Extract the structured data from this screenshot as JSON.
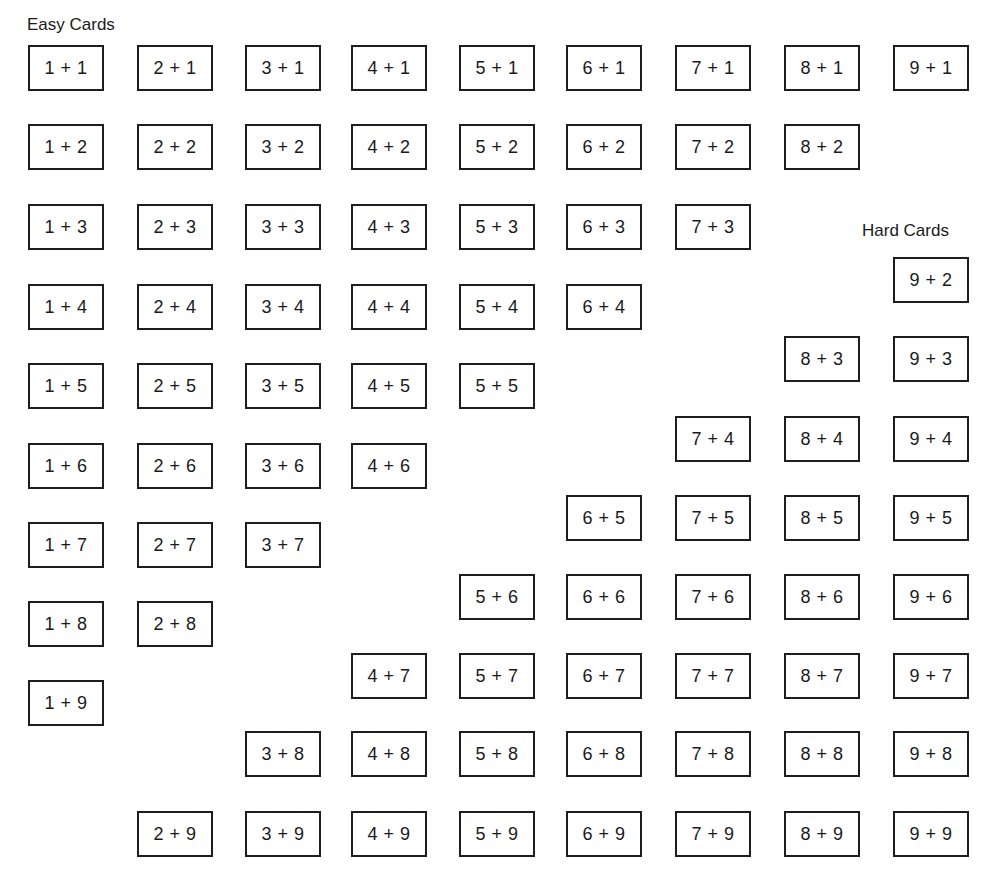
{
  "labels": {
    "easy": "Easy Cards",
    "hard": "Hard Cards"
  },
  "layout": {
    "col_x": [
      28,
      137,
      245,
      351,
      459,
      566,
      675,
      784,
      893
    ],
    "easy_row_y": [
      45,
      124,
      204,
      284,
      363,
      443,
      522,
      601,
      680
    ],
    "hard_row_y": [
      257,
      336,
      416,
      495,
      574,
      653,
      731,
      811
    ],
    "card_width": 76,
    "card_height": 46
  },
  "cards": [
    {
      "a": 1,
      "b": 1,
      "text": "1 + 1",
      "group": "easy",
      "col": 0,
      "y": 45
    },
    {
      "a": 2,
      "b": 1,
      "text": "2 + 1",
      "group": "easy",
      "col": 1,
      "y": 45
    },
    {
      "a": 3,
      "b": 1,
      "text": "3 + 1",
      "group": "easy",
      "col": 2,
      "y": 45
    },
    {
      "a": 4,
      "b": 1,
      "text": "4 + 1",
      "group": "easy",
      "col": 3,
      "y": 45
    },
    {
      "a": 5,
      "b": 1,
      "text": "5 + 1",
      "group": "easy",
      "col": 4,
      "y": 45
    },
    {
      "a": 6,
      "b": 1,
      "text": "6 + 1",
      "group": "easy",
      "col": 5,
      "y": 45
    },
    {
      "a": 7,
      "b": 1,
      "text": "7 + 1",
      "group": "easy",
      "col": 6,
      "y": 45
    },
    {
      "a": 8,
      "b": 1,
      "text": "8 + 1",
      "group": "easy",
      "col": 7,
      "y": 45
    },
    {
      "a": 9,
      "b": 1,
      "text": "9 + 1",
      "group": "easy",
      "col": 8,
      "y": 45
    },
    {
      "a": 1,
      "b": 2,
      "text": "1 + 2",
      "group": "easy",
      "col": 0,
      "y": 124
    },
    {
      "a": 2,
      "b": 2,
      "text": "2 + 2",
      "group": "easy",
      "col": 1,
      "y": 124
    },
    {
      "a": 3,
      "b": 2,
      "text": "3 + 2",
      "group": "easy",
      "col": 2,
      "y": 124
    },
    {
      "a": 4,
      "b": 2,
      "text": "4 + 2",
      "group": "easy",
      "col": 3,
      "y": 124
    },
    {
      "a": 5,
      "b": 2,
      "text": "5 + 2",
      "group": "easy",
      "col": 4,
      "y": 124
    },
    {
      "a": 6,
      "b": 2,
      "text": "6 + 2",
      "group": "easy",
      "col": 5,
      "y": 124
    },
    {
      "a": 7,
      "b": 2,
      "text": "7 + 2",
      "group": "easy",
      "col": 6,
      "y": 124
    },
    {
      "a": 8,
      "b": 2,
      "text": "8 + 2",
      "group": "easy",
      "col": 7,
      "y": 124
    },
    {
      "a": 1,
      "b": 3,
      "text": "1 + 3",
      "group": "easy",
      "col": 0,
      "y": 204
    },
    {
      "a": 2,
      "b": 3,
      "text": "2 + 3",
      "group": "easy",
      "col": 1,
      "y": 204
    },
    {
      "a": 3,
      "b": 3,
      "text": "3 + 3",
      "group": "easy",
      "col": 2,
      "y": 204
    },
    {
      "a": 4,
      "b": 3,
      "text": "4 + 3",
      "group": "easy",
      "col": 3,
      "y": 204
    },
    {
      "a": 5,
      "b": 3,
      "text": "5 + 3",
      "group": "easy",
      "col": 4,
      "y": 204
    },
    {
      "a": 6,
      "b": 3,
      "text": "6 + 3",
      "group": "easy",
      "col": 5,
      "y": 204
    },
    {
      "a": 7,
      "b": 3,
      "text": "7 + 3",
      "group": "easy",
      "col": 6,
      "y": 204
    },
    {
      "a": 1,
      "b": 4,
      "text": "1 + 4",
      "group": "easy",
      "col": 0,
      "y": 284
    },
    {
      "a": 2,
      "b": 4,
      "text": "2 + 4",
      "group": "easy",
      "col": 1,
      "y": 284
    },
    {
      "a": 3,
      "b": 4,
      "text": "3 + 4",
      "group": "easy",
      "col": 2,
      "y": 284
    },
    {
      "a": 4,
      "b": 4,
      "text": "4 + 4",
      "group": "easy",
      "col": 3,
      "y": 284
    },
    {
      "a": 5,
      "b": 4,
      "text": "5 + 4",
      "group": "easy",
      "col": 4,
      "y": 284
    },
    {
      "a": 6,
      "b": 4,
      "text": "6 + 4",
      "group": "easy",
      "col": 5,
      "y": 284
    },
    {
      "a": 1,
      "b": 5,
      "text": "1 + 5",
      "group": "easy",
      "col": 0,
      "y": 363
    },
    {
      "a": 2,
      "b": 5,
      "text": "2 + 5",
      "group": "easy",
      "col": 1,
      "y": 363
    },
    {
      "a": 3,
      "b": 5,
      "text": "3 + 5",
      "group": "easy",
      "col": 2,
      "y": 363
    },
    {
      "a": 4,
      "b": 5,
      "text": "4 + 5",
      "group": "easy",
      "col": 3,
      "y": 363
    },
    {
      "a": 5,
      "b": 5,
      "text": "5 + 5",
      "group": "easy",
      "col": 4,
      "y": 363
    },
    {
      "a": 1,
      "b": 6,
      "text": "1 + 6",
      "group": "easy",
      "col": 0,
      "y": 443
    },
    {
      "a": 2,
      "b": 6,
      "text": "2 + 6",
      "group": "easy",
      "col": 1,
      "y": 443
    },
    {
      "a": 3,
      "b": 6,
      "text": "3 + 6",
      "group": "easy",
      "col": 2,
      "y": 443
    },
    {
      "a": 4,
      "b": 6,
      "text": "4 + 6",
      "group": "easy",
      "col": 3,
      "y": 443
    },
    {
      "a": 1,
      "b": 7,
      "text": "1 + 7",
      "group": "easy",
      "col": 0,
      "y": 522
    },
    {
      "a": 2,
      "b": 7,
      "text": "2 + 7",
      "group": "easy",
      "col": 1,
      "y": 522
    },
    {
      "a": 3,
      "b": 7,
      "text": "3 + 7",
      "group": "easy",
      "col": 2,
      "y": 522
    },
    {
      "a": 1,
      "b": 8,
      "text": "1 + 8",
      "group": "easy",
      "col": 0,
      "y": 601
    },
    {
      "a": 2,
      "b": 8,
      "text": "2 + 8",
      "group": "easy",
      "col": 1,
      "y": 601
    },
    {
      "a": 1,
      "b": 9,
      "text": "1 + 9",
      "group": "easy",
      "col": 0,
      "y": 680
    },
    {
      "a": 9,
      "b": 2,
      "text": "9 + 2",
      "group": "hard",
      "col": 8,
      "y": 257
    },
    {
      "a": 8,
      "b": 3,
      "text": "8 + 3",
      "group": "hard",
      "col": 7,
      "y": 336
    },
    {
      "a": 9,
      "b": 3,
      "text": "9 + 3",
      "group": "hard",
      "col": 8,
      "y": 336
    },
    {
      "a": 7,
      "b": 4,
      "text": "7 + 4",
      "group": "hard",
      "col": 6,
      "y": 416
    },
    {
      "a": 8,
      "b": 4,
      "text": "8 + 4",
      "group": "hard",
      "col": 7,
      "y": 416
    },
    {
      "a": 9,
      "b": 4,
      "text": "9 + 4",
      "group": "hard",
      "col": 8,
      "y": 416
    },
    {
      "a": 6,
      "b": 5,
      "text": "6 + 5",
      "group": "hard",
      "col": 5,
      "y": 495
    },
    {
      "a": 7,
      "b": 5,
      "text": "7 + 5",
      "group": "hard",
      "col": 6,
      "y": 495
    },
    {
      "a": 8,
      "b": 5,
      "text": "8 + 5",
      "group": "hard",
      "col": 7,
      "y": 495
    },
    {
      "a": 9,
      "b": 5,
      "text": "9 + 5",
      "group": "hard",
      "col": 8,
      "y": 495
    },
    {
      "a": 5,
      "b": 6,
      "text": "5 + 6",
      "group": "hard",
      "col": 4,
      "y": 574
    },
    {
      "a": 6,
      "b": 6,
      "text": "6 + 6",
      "group": "hard",
      "col": 5,
      "y": 574
    },
    {
      "a": 7,
      "b": 6,
      "text": "7 + 6",
      "group": "hard",
      "col": 6,
      "y": 574
    },
    {
      "a": 8,
      "b": 6,
      "text": "8 + 6",
      "group": "hard",
      "col": 7,
      "y": 574
    },
    {
      "a": 9,
      "b": 6,
      "text": "9 + 6",
      "group": "hard",
      "col": 8,
      "y": 574
    },
    {
      "a": 4,
      "b": 7,
      "text": "4 + 7",
      "group": "hard",
      "col": 3,
      "y": 653
    },
    {
      "a": 5,
      "b": 7,
      "text": "5 + 7",
      "group": "hard",
      "col": 4,
      "y": 653
    },
    {
      "a": 6,
      "b": 7,
      "text": "6 + 7",
      "group": "hard",
      "col": 5,
      "y": 653
    },
    {
      "a": 7,
      "b": 7,
      "text": "7 + 7",
      "group": "hard",
      "col": 6,
      "y": 653
    },
    {
      "a": 8,
      "b": 7,
      "text": "8 + 7",
      "group": "hard",
      "col": 7,
      "y": 653
    },
    {
      "a": 9,
      "b": 7,
      "text": "9 + 7",
      "group": "hard",
      "col": 8,
      "y": 653
    },
    {
      "a": 3,
      "b": 8,
      "text": "3 + 8",
      "group": "hard",
      "col": 2,
      "y": 731
    },
    {
      "a": 4,
      "b": 8,
      "text": "4 + 8",
      "group": "hard",
      "col": 3,
      "y": 731
    },
    {
      "a": 5,
      "b": 8,
      "text": "5 + 8",
      "group": "hard",
      "col": 4,
      "y": 731
    },
    {
      "a": 6,
      "b": 8,
      "text": "6 + 8",
      "group": "hard",
      "col": 5,
      "y": 731
    },
    {
      "a": 7,
      "b": 8,
      "text": "7 + 8",
      "group": "hard",
      "col": 6,
      "y": 731
    },
    {
      "a": 8,
      "b": 8,
      "text": "8 + 8",
      "group": "hard",
      "col": 7,
      "y": 731
    },
    {
      "a": 9,
      "b": 8,
      "text": "9 + 8",
      "group": "hard",
      "col": 8,
      "y": 731
    },
    {
      "a": 2,
      "b": 9,
      "text": "2 + 9",
      "group": "hard",
      "col": 1,
      "y": 811
    },
    {
      "a": 3,
      "b": 9,
      "text": "3 + 9",
      "group": "hard",
      "col": 2,
      "y": 811
    },
    {
      "a": 4,
      "b": 9,
      "text": "4 + 9",
      "group": "hard",
      "col": 3,
      "y": 811
    },
    {
      "a": 5,
      "b": 9,
      "text": "5 + 9",
      "group": "hard",
      "col": 4,
      "y": 811
    },
    {
      "a": 6,
      "b": 9,
      "text": "6 + 9",
      "group": "hard",
      "col": 5,
      "y": 811
    },
    {
      "a": 7,
      "b": 9,
      "text": "7 + 9",
      "group": "hard",
      "col": 6,
      "y": 811
    },
    {
      "a": 8,
      "b": 9,
      "text": "8 + 9",
      "group": "hard",
      "col": 7,
      "y": 811
    },
    {
      "a": 9,
      "b": 9,
      "text": "9 + 9",
      "group": "hard",
      "col": 8,
      "y": 811
    }
  ]
}
